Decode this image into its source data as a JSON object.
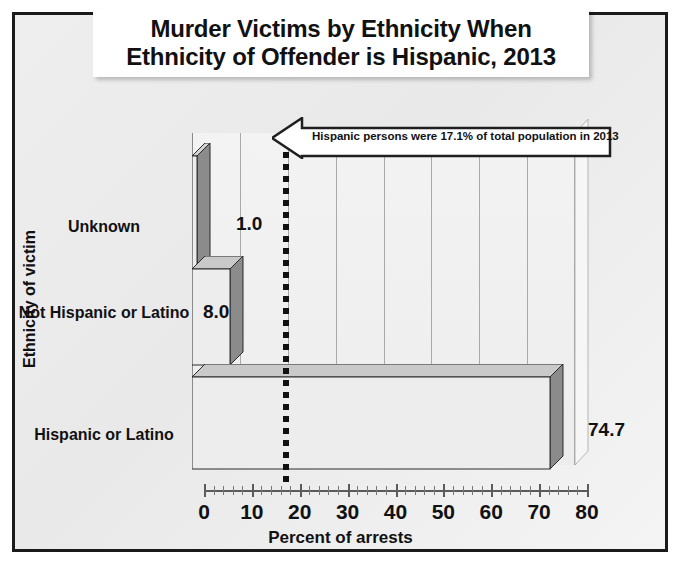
{
  "chart_data": {
    "type": "bar",
    "orientation": "horizontal",
    "title": "Murder Victims by Ethnicity When Ethnicity of Offender is Hispanic, 2013",
    "title_lines": [
      "Murder Victims by Ethnicity When",
      "Ethnicity of Offender is Hispanic, 2013"
    ],
    "categories": [
      "Hispanic or Latino",
      "Not Hispanic or Latino",
      "Unknown"
    ],
    "values": [
      74.7,
      8.0,
      1.0
    ],
    "value_labels": [
      "74.7",
      "8.0",
      "1.0"
    ],
    "xlabel": "Percent of arrests",
    "ylabel": "Ethnicity of victim",
    "xlim": [
      0,
      80
    ],
    "xticks": [
      0,
      10,
      20,
      30,
      40,
      50,
      60,
      70,
      80
    ],
    "xtick_labels": [
      "0",
      "10",
      "20",
      "30",
      "40",
      "50",
      "60",
      "70",
      "80"
    ],
    "minor_tick_step": 2,
    "grid": "vertical-major",
    "legend": "none",
    "annotations": [
      {
        "name": "reference-line",
        "type": "vertical-dashed-line",
        "value": 17.1,
        "label": "Hispanic persons were 17.1% of total population in 2013"
      }
    ]
  },
  "callout": {
    "text": "Hispanic persons were 17.1% of total population in 2013"
  },
  "colors": {
    "bar_front_light": "#ebebeb",
    "bar_front_dark": "#878787",
    "bar_top": "#c9c9c9",
    "bar_side": "#6e6e6e",
    "frame": "#1a1a1a",
    "background": "#ededed",
    "gridline": "#a9a9a9",
    "text": "#111111"
  }
}
